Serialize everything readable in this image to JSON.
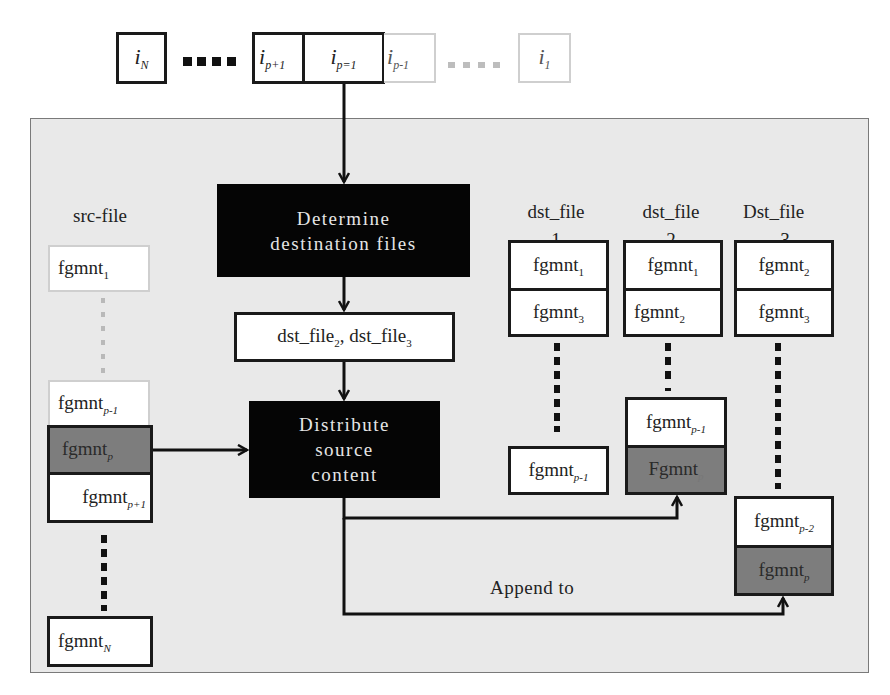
{
  "queue": {
    "items": [
      {
        "name": "i",
        "sub": "N",
        "style": "solid"
      },
      {
        "name": "i",
        "sub": "p+1",
        "style": "solid"
      },
      {
        "name": "i",
        "sub": "p=1",
        "style": "solid"
      },
      {
        "name": "i",
        "sub": "p-1",
        "style": "faded"
      },
      {
        "name": "i",
        "sub": "1",
        "style": "faded"
      }
    ]
  },
  "process": {
    "determine": {
      "line1": "Determine",
      "line2": "destination files"
    },
    "selected_files": {
      "a": "dst_file",
      "a_sub": "2",
      "sep": ", ",
      "b": "dst_file",
      "b_sub": "3"
    },
    "distribute": {
      "line1": "Distribute",
      "line2": "source",
      "line3": "content"
    },
    "append_label": "Append to"
  },
  "src_file": {
    "label": "src-file",
    "fragments": [
      {
        "text": "fgmnt",
        "sub": "1",
        "style": "faded"
      },
      {
        "text": "fgmnt",
        "sub": "p-1",
        "style": "faded"
      },
      {
        "text": "fgmnt",
        "sub": "p",
        "style": "grey"
      },
      {
        "text": "fgmnt",
        "sub": "p+1",
        "style": "solid"
      },
      {
        "text": "fgmnt",
        "sub": "N",
        "style": "solid"
      }
    ]
  },
  "dst_files": [
    {
      "label_line1": "dst_file",
      "label_line2": "1",
      "fragments": [
        {
          "text": "fgmnt",
          "sub": "1"
        },
        {
          "text": "fgmnt",
          "sub": "3"
        },
        {
          "text": "fgmnt",
          "sub": "p-1"
        }
      ]
    },
    {
      "label_line1": "dst_file",
      "label_line2": "2",
      "fragments": [
        {
          "text": "fgmnt",
          "sub": "1"
        },
        {
          "text": "fgmnt",
          "sub": "2"
        },
        {
          "text": "fgmnt",
          "sub": "p-1"
        },
        {
          "text": "Fgmnt",
          "sub": "p",
          "style": "grey"
        }
      ]
    },
    {
      "label_line1": "Dst_file",
      "label_line2": "3",
      "fragments": [
        {
          "text": "fgmnt",
          "sub": "2"
        },
        {
          "text": "fgmnt",
          "sub": "3"
        },
        {
          "text": "fgmnt",
          "sub": "p-2"
        },
        {
          "text": "fgmnt",
          "sub": "p",
          "style": "grey"
        }
      ]
    }
  ],
  "colors": {
    "frame_bg": "#e9e9e9",
    "process_box": "#050505",
    "highlight_fragment": "#7d7d7d",
    "faded_border": "#cfcfcf"
  }
}
